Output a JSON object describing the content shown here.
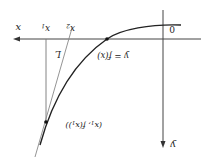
{
  "figure": {
    "orientation": "rotated 180 degrees",
    "labels": {
      "x_axis": "x",
      "y_axis": "y",
      "origin": "0",
      "x1": "x",
      "x1_sub": "1",
      "x2": "x",
      "x2_sub": "2",
      "tangent": "L",
      "curve": "y = f(x)",
      "point": "(x",
      "point_sub": "1",
      "point_rest": ", f(x",
      "point_sub2": "1",
      "point_end": "))"
    },
    "colors": {
      "axis": "#444444",
      "curve": "#222222",
      "tangent": "#777777",
      "guide": "#777777"
    }
  }
}
